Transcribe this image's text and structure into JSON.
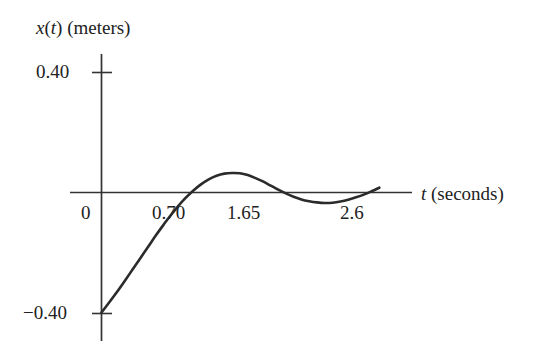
{
  "chart_data": {
    "type": "line",
    "title": "",
    "subtitle": "",
    "xlabel": "t (seconds)",
    "xlabel_italic_part": "t",
    "xlabel_rest": " (seconds)",
    "ylabel": "x(t) (meters)",
    "ylabel_parts": {
      "var": "x",
      "open": "(",
      "arg": "t",
      "close": ")",
      "units": " (meters)"
    },
    "xlim": [
      -0.25,
      3.1
    ],
    "ylim": [
      -0.48,
      0.48
    ],
    "grid": false,
    "legend": null,
    "x_tick_labels": [
      "0",
      "0.70",
      "1.65",
      "2.6"
    ],
    "x_tick_values": [
      0,
      0.7,
      1.65,
      2.6
    ],
    "y_tick_labels": [
      "0.40",
      "−0.40"
    ],
    "y_tick_values": [
      0.4,
      -0.4
    ],
    "annotations": [],
    "series": [
      {
        "name": "x(t)",
        "color": "#2b2b2b",
        "x": [
          0.0,
          0.08,
          0.16,
          0.24,
          0.32,
          0.4,
          0.48,
          0.56,
          0.64,
          0.7,
          0.78,
          0.86,
          0.94,
          1.02,
          1.1,
          1.18,
          1.26,
          1.34,
          1.42,
          1.5,
          1.58,
          1.65,
          1.73,
          1.81,
          1.89,
          1.97,
          2.05,
          2.13,
          2.21,
          2.29,
          2.37,
          2.45,
          2.53,
          2.61,
          2.69,
          2.77,
          2.85
        ],
        "y": [
          -0.4,
          -0.366,
          -0.331,
          -0.294,
          -0.256,
          -0.218,
          -0.18,
          -0.142,
          -0.106,
          -0.08,
          -0.048,
          -0.019,
          0.006,
          0.027,
          0.044,
          0.056,
          0.063,
          0.065,
          0.064,
          0.058,
          0.048,
          0.038,
          0.024,
          0.01,
          -0.003,
          -0.014,
          -0.023,
          -0.029,
          -0.033,
          -0.035,
          -0.034,
          -0.03,
          -0.024,
          -0.016,
          -0.007,
          0.004,
          0.016
        ]
      }
    ]
  },
  "axes": {
    "y_axis_name": "vertical-axis",
    "x_axis_name": "horizontal-axis"
  }
}
